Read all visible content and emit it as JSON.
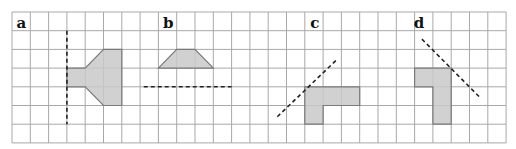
{
  "grid": {
    "origin_x": 12,
    "origin_y": 12,
    "cell_w": 18.3,
    "cell_h": 18.7,
    "cols": 27,
    "rows": 7,
    "line_color": "#a8a8a8"
  },
  "colors": {
    "shape_fill": "#c9c9c9",
    "shape_stroke": "#7a7a7a",
    "mirror_line": "#222222"
  },
  "panels": [
    {
      "label": "a",
      "label_pos": [
        0.25,
        1.0
      ],
      "shape": [
        [
          3,
          3
        ],
        [
          4,
          3
        ],
        [
          5,
          2
        ],
        [
          6,
          2
        ],
        [
          6,
          5
        ],
        [
          5,
          5
        ],
        [
          4,
          4
        ],
        [
          3,
          4
        ]
      ],
      "mirror_line": [
        [
          3,
          1
        ],
        [
          3,
          6
        ]
      ]
    },
    {
      "label": "b",
      "label_pos": [
        8.25,
        1.0
      ],
      "shape": [
        [
          8,
          3
        ],
        [
          9,
          2
        ],
        [
          10,
          2
        ],
        [
          11,
          3
        ]
      ],
      "mirror_line": [
        [
          7.2,
          4
        ],
        [
          12,
          4
        ]
      ]
    },
    {
      "label": "c",
      "label_pos": [
        16.3,
        1.0
      ],
      "shape": [
        [
          16,
          4
        ],
        [
          19,
          4
        ],
        [
          19,
          5
        ],
        [
          17,
          5
        ],
        [
          17,
          6
        ],
        [
          16,
          6
        ]
      ],
      "mirror_line": [
        [
          14.5,
          5.6
        ],
        [
          17.8,
          2.5
        ]
      ]
    },
    {
      "label": "d",
      "label_pos": [
        21.95,
        1.0
      ],
      "shape": [
        [
          22,
          3
        ],
        [
          24,
          3
        ],
        [
          24,
          6
        ],
        [
          23,
          6
        ],
        [
          23,
          4
        ],
        [
          22,
          4
        ]
      ],
      "mirror_line": [
        [
          22.4,
          1.45
        ],
        [
          25.6,
          4.6
        ]
      ]
    }
  ]
}
